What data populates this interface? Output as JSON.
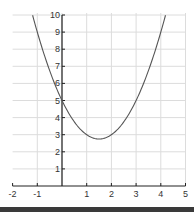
{
  "chart_data": {
    "type": "line",
    "title": "",
    "xlabel": "",
    "ylabel": "",
    "function": "y = x^2 - 3x + 5",
    "xlim": [
      -2,
      5
    ],
    "ylim": [
      0,
      10
    ],
    "x_ticks": [
      "-2",
      "-1",
      "1",
      "2",
      "3",
      "4",
      "5"
    ],
    "y_ticks": [
      "1",
      "2",
      "3",
      "4",
      "5",
      "6",
      "7",
      "8",
      "9",
      "10"
    ],
    "grid": true,
    "legend": null,
    "series": [
      {
        "name": "parabola",
        "color": "#555555",
        "x": [
          -1.19,
          -1,
          -0.5,
          0,
          0.5,
          1,
          1.5,
          2,
          2.5,
          3,
          3.5,
          4,
          4.19
        ],
        "y": [
          10,
          9,
          6.75,
          5,
          3.75,
          3,
          2.75,
          3,
          3.75,
          5,
          6.75,
          9,
          10
        ]
      }
    ],
    "vertex": {
      "x": 1.5,
      "y": 2.75
    }
  },
  "colors": {
    "grid": "#dcdcdc",
    "axis": "#222222",
    "curve": "#555555",
    "bottom_bar": "#3a3a3a"
  }
}
